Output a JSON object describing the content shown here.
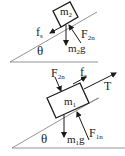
{
  "top_diagram": {
    "block_label": {
      "base": "m",
      "sub": "2"
    },
    "friction_label": {
      "base": "f",
      "sub": "s"
    },
    "normal_label": {
      "base": "F",
      "sub": "2n"
    },
    "weight_label": {
      "base": "m",
      "sub": "2",
      "tail": "g"
    },
    "angle_label": "θ"
  },
  "bottom_diagram": {
    "block_label": {
      "base": "m",
      "sub": "1"
    },
    "friction_label": {
      "base": "f",
      "sub": "s"
    },
    "normal_top_label": {
      "base": "F",
      "sub": "2n"
    },
    "normal_bottom_label": {
      "base": "F",
      "sub": "1n"
    },
    "weight_label": {
      "base": "m",
      "sub": "1",
      "tail": "g"
    },
    "tension_label": "T",
    "angle_label": "θ"
  },
  "colors": {
    "ink": "#1a1a1a",
    "incline": "#7a7a7a",
    "background": "#ffffff"
  }
}
